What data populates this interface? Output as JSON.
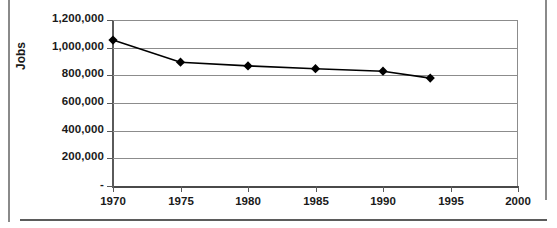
{
  "chart_data": {
    "type": "line",
    "title": "",
    "xlabel": "",
    "ylabel": "Jobs",
    "xlim": [
      1970,
      2000
    ],
    "ylim": [
      0,
      1200000
    ],
    "grid": true,
    "legend": false,
    "marker": "diamond",
    "series_color": "#000000",
    "grid_color": "#8c8c8c",
    "x": [
      1970,
      1975,
      1980,
      1985,
      1990,
      1993.5
    ],
    "values": [
      1055000,
      895000,
      868000,
      848000,
      830000,
      780000
    ],
    "series": [
      {
        "name": "Jobs",
        "x": [
          1970,
          1975,
          1980,
          1985,
          1990,
          1993.5
        ],
        "values": [
          1055000,
          895000,
          868000,
          848000,
          830000,
          780000
        ]
      }
    ],
    "xticks": [
      1970,
      1975,
      1980,
      1985,
      1990,
      1995,
      2000
    ],
    "xticklabels": [
      "1970",
      "1975",
      "1980",
      "1985",
      "1990",
      "1995",
      "2000"
    ],
    "yticks": [
      0,
      200000,
      400000,
      600000,
      800000,
      1000000,
      1200000
    ],
    "yticklabels": [
      "-",
      "200,000",
      "400,000",
      "600,000",
      "800,000",
      "1,000,000",
      "1,200,000"
    ]
  }
}
